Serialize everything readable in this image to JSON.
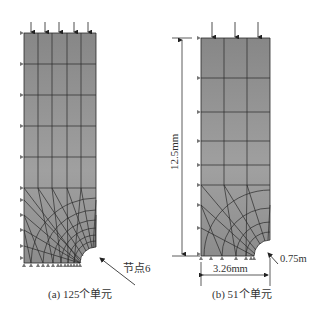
{
  "figure": {
    "panels": [
      {
        "id": "a",
        "caption": "(a) 125个单元",
        "element_count": 125,
        "annotation": "节点6"
      },
      {
        "id": "b",
        "caption": "(b) 51个单元",
        "element_count": 51,
        "dimensions": {
          "height": "12.5mm",
          "width": "3.26mm",
          "radius": "0.75m"
        }
      }
    ]
  },
  "colors": {
    "mesh_fill_top": "#8a8a8a",
    "mesh_fill_bottom": "#9c9c9c",
    "mesh_line": "#2a2a2a",
    "arrow": "#222222",
    "support": "#777777"
  }
}
